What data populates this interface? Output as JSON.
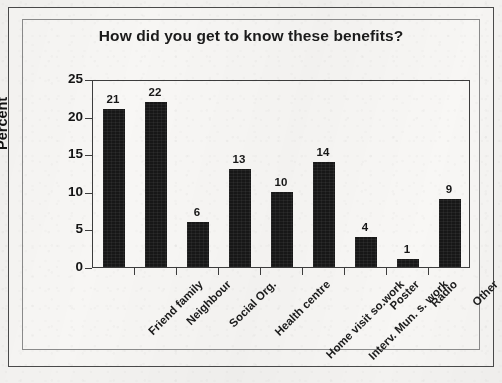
{
  "page": {
    "top_cut_caption": "",
    "background_color": "#f3f2f0"
  },
  "frames": {
    "outer_label": "outer-border",
    "inner_label": "inner-border"
  },
  "chart_data": {
    "type": "bar",
    "title": "How did you get to know these benefits?",
    "xlabel": "",
    "ylabel": "Percent",
    "ylim": [
      0,
      25
    ],
    "yticks": [
      0,
      5,
      10,
      15,
      20,
      25
    ],
    "grid": false,
    "legend": null,
    "bar_color": "#171717",
    "orientation": "vertical",
    "value_labels_shown": true,
    "xtick_rotation_deg": -45,
    "categories": [
      "Friend family",
      "Neighbour",
      "Social Org.",
      "Health centre",
      "Home visit so.work",
      "Interv. Mun. s. work",
      "Poster",
      "Radio",
      "Other"
    ],
    "values": [
      21,
      22,
      6,
      13,
      10,
      14,
      4,
      1,
      9
    ],
    "value_label_texts": [
      "21",
      "22",
      "6",
      "13",
      "10",
      "14",
      "4",
      "1",
      "9"
    ],
    "ytick_labels": [
      "0",
      "5",
      "10",
      "15",
      "20",
      "25"
    ]
  }
}
